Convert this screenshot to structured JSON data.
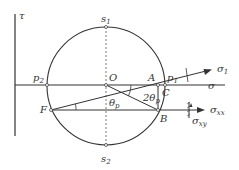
{
  "diagram": {
    "axes": {
      "tau_label": "τ",
      "sigma_label": "σ"
    },
    "points": {
      "O": "O",
      "A": "A",
      "B": "B",
      "C": "C",
      "F": "F",
      "p1": "p",
      "p1_sub": "1",
      "p2": "p",
      "p2_sub": "2",
      "s1": "s",
      "s1_sub": "1",
      "s2": "s",
      "s2_sub": "2"
    },
    "angles": {
      "theta_p": "θ",
      "theta_p_sub": "p",
      "two_theta_p": "2θ",
      "two_theta_p_sub": "p"
    },
    "arrows": {
      "sigma1": "σ",
      "sigma1_sub": "1",
      "sigma_xx": "σ",
      "sigma_xx_sub": "xx",
      "sigma_xy": "σ",
      "sigma_xy_sub": "xy"
    },
    "colors": {
      "line": "#333333",
      "background": "#ffffff"
    }
  }
}
